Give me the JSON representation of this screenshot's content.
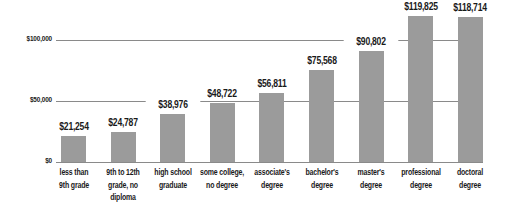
{
  "chart_data": {
    "type": "bar",
    "title": "",
    "xlabel": "",
    "ylabel": "",
    "ylim": [
      0,
      120000
    ],
    "yticks": [
      {
        "value": 0,
        "label": "$0"
      },
      {
        "value": 50000,
        "label": "$50,000"
      },
      {
        "value": 100000,
        "label": "$100,000"
      }
    ],
    "grid": true,
    "legend": null,
    "categories": [
      "less than 9th grade",
      "9th to 12th grade, no diploma",
      "high school graduate",
      "some college, no degree",
      "associate's degree",
      "bachelor's degree",
      "master's degree",
      "professional degree",
      "doctoral degree"
    ],
    "category_lines": [
      [
        "less than",
        "9th grade"
      ],
      [
        "9th to 12th",
        "grade, no",
        "diploma"
      ],
      [
        "high school",
        "graduate"
      ],
      [
        "some college,",
        "no degree"
      ],
      [
        "associate's",
        "degree"
      ],
      [
        "bachelor's",
        "degree"
      ],
      [
        "master's",
        "degree"
      ],
      [
        "professional",
        "degree"
      ],
      [
        "doctoral",
        "degree"
      ]
    ],
    "values": [
      21254,
      24787,
      38976,
      48722,
      56811,
      75568,
      90802,
      119825,
      118714
    ],
    "value_labels": [
      "$21,254",
      "$24,787",
      "$38,976",
      "$48,722",
      "$56,811",
      "$75,568",
      "$90,802",
      "$119,825",
      "$118,714"
    ],
    "colors": {
      "bar": "#9b9b9b",
      "grid": "#8a8a8a",
      "text": "#1a1a1a"
    }
  }
}
